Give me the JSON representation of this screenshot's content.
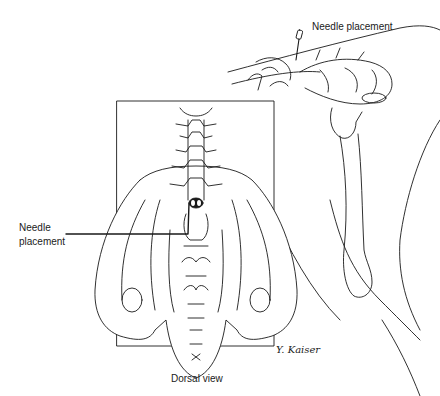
{
  "labels": {
    "top_needle": "Needle placement",
    "left_needle_line1": "Needle",
    "left_needle_line2": "placement",
    "caption": "Dorsal view",
    "signature": "Y. Kaiser"
  },
  "colors": {
    "line": "#1a1a1a",
    "background": "#ffffff"
  }
}
